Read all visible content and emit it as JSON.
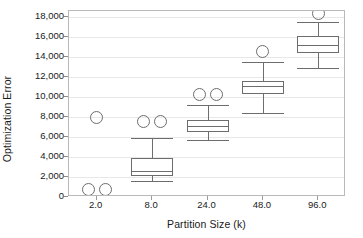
{
  "chart_data": {
    "type": "box",
    "title": "",
    "xlabel": "Partition Size (k)",
    "ylabel": "Optimization Error",
    "categories": [
      "2.0",
      "8.0",
      "24.0",
      "48.0",
      "96.0"
    ],
    "ylim": [
      0,
      18000
    ],
    "ytick_labels": [
      "0",
      "2,000",
      "4,000",
      "6,000",
      "8,000",
      "10,000",
      "12,000",
      "14,000",
      "16,000",
      "18,000"
    ],
    "ytick_values": [
      0,
      2000,
      4000,
      6000,
      8000,
      10000,
      12000,
      14000,
      16000,
      18000
    ],
    "xtick_labels": [
      "2.0",
      "8.0",
      "24.0",
      "48.0",
      "96.0"
    ],
    "grid": true,
    "legend": "none",
    "boxes": [
      {
        "category": "2.0",
        "has_box": false,
        "whisker_low": null,
        "q1": null,
        "median": null,
        "q3": null,
        "whisker_high": null,
        "outliers": [
          8000,
          800,
          800
        ]
      },
      {
        "category": "8.0",
        "has_box": true,
        "whisker_low": 1650,
        "q1": 2150,
        "median": 2600,
        "q3": 3950,
        "whisker_high": 5900,
        "outliers": [
          7600,
          7600
        ]
      },
      {
        "category": "24.0",
        "has_box": true,
        "whisker_low": 5750,
        "q1": 6500,
        "median": 7100,
        "q3": 7750,
        "whisker_high": 9200,
        "outliers": [
          10300,
          10300
        ]
      },
      {
        "category": "48.0",
        "has_box": true,
        "whisker_low": 8400,
        "q1": 10300,
        "median": 11100,
        "q3": 11650,
        "whisker_high": 13500,
        "outliers": [
          14550
        ]
      },
      {
        "category": "96.0",
        "has_box": true,
        "whisker_low": 12900,
        "q1": 14450,
        "median": 15200,
        "q3": 16100,
        "whisker_high": 17550,
        "outliers": [
          18400
        ]
      }
    ]
  },
  "axes": {
    "y_title": "Optimization Error",
    "x_title": "Partition Size (k)"
  },
  "colors": {
    "line": "#6d6d6d",
    "frame": "#b9b9b9",
    "grid": "#e8e8e8",
    "text": "#1a1a1a",
    "background": "#ffffff"
  }
}
